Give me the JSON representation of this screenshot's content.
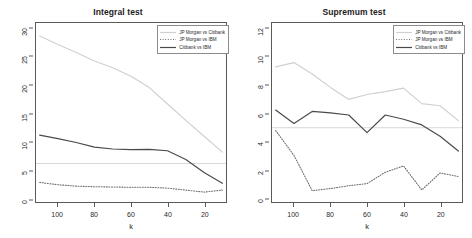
{
  "figure": {
    "background": "#ffffff",
    "axis_color": "#5a5a5a"
  },
  "series_style": {
    "jpm_citi": {
      "color": "#d0d0d0",
      "dash": "none",
      "width": 1.2
    },
    "jpm_ibm": {
      "color": "#707070",
      "dash": "1,1.6",
      "width": 1.1
    },
    "citi_ibm": {
      "color": "#4a4a4a",
      "dash": "none",
      "width": 1.2
    },
    "reference": {
      "color": "#d8d8d8",
      "dash": "none",
      "width": 1
    }
  },
  "legend": {
    "items": [
      {
        "label": "JP Morgan vs Citibank",
        "key": "jpm_citi"
      },
      {
        "label": "JP Morgan vs IBM",
        "key": "jpm_ibm"
      },
      {
        "label": "Citibank vs IBM",
        "key": "citi_ibm"
      }
    ]
  },
  "chart_data": [
    {
      "type": "line",
      "panel": "left",
      "title": "Integral test",
      "xlabel": "k",
      "ylabel": "",
      "xlim": [
        112,
        8
      ],
      "ylim": [
        -0.6,
        31
      ],
      "x_reversed": true,
      "grid": false,
      "legend_position": "top-right",
      "xticks": [
        100,
        80,
        60,
        40,
        20
      ],
      "yticks": [
        0,
        5,
        10,
        15,
        20,
        25,
        30
      ],
      "reference_line_y": 6.2,
      "x": [
        110,
        100,
        90,
        80,
        70,
        60,
        50,
        40,
        30,
        20,
        10
      ],
      "series": [
        {
          "name": "JP Morgan vs Citibank",
          "key": "jpm_citi",
          "values": [
            28.7,
            27.2,
            25.8,
            24.3,
            23.1,
            21.6,
            19.6,
            16.7,
            13.8,
            11.0,
            8.2
          ]
        },
        {
          "name": "JP Morgan vs IBM",
          "key": "jpm_ibm",
          "values": [
            2.85,
            2.45,
            2.2,
            2.1,
            2.05,
            2.0,
            2.0,
            1.85,
            1.5,
            1.15,
            1.5
          ]
        },
        {
          "name": "Citibank vs IBM",
          "key": "citi_ibm",
          "values": [
            11.2,
            10.6,
            9.9,
            9.1,
            8.75,
            8.65,
            8.7,
            8.45,
            6.9,
            4.6,
            2.7
          ]
        }
      ]
    },
    {
      "type": "line",
      "panel": "right",
      "title": "Supremum test",
      "xlabel": "k",
      "ylabel": "",
      "xlim": [
        112,
        8
      ],
      "ylim": [
        -0.25,
        12.4
      ],
      "x_reversed": true,
      "grid": false,
      "legend_position": "top-right",
      "xticks": [
        100,
        80,
        60,
        40,
        20
      ],
      "yticks": [
        0,
        2,
        4,
        6,
        8,
        10,
        12
      ],
      "reference_line_y": 5.0,
      "x": [
        110,
        100,
        90,
        80,
        70,
        60,
        50,
        40,
        30,
        20,
        10
      ],
      "series": [
        {
          "name": "JP Morgan vs Citibank",
          "key": "jpm_citi",
          "values": [
            9.3,
            9.6,
            8.8,
            7.85,
            7.0,
            7.35,
            7.55,
            7.8,
            6.7,
            6.55,
            5.5
          ]
        },
        {
          "name": "JP Morgan vs IBM",
          "key": "jpm_ibm",
          "values": [
            4.8,
            3.05,
            0.55,
            0.7,
            0.9,
            1.05,
            1.85,
            2.3,
            0.6,
            1.8,
            1.55
          ]
        },
        {
          "name": "Citibank vs IBM",
          "key": "citi_ibm",
          "values": [
            6.25,
            5.3,
            6.15,
            6.05,
            5.9,
            4.65,
            5.9,
            5.6,
            5.2,
            4.4,
            3.35
          ]
        }
      ]
    }
  ]
}
